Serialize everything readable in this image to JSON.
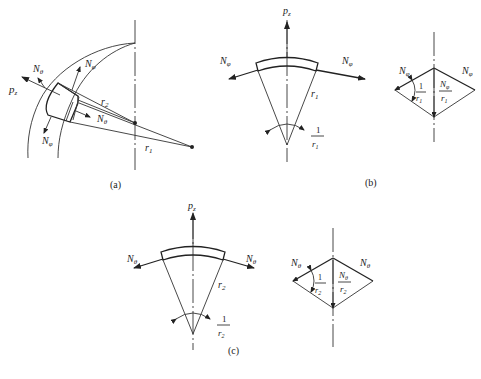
{
  "figure": {
    "panels": [
      {
        "id": "a",
        "caption": "(a)",
        "labels": {
          "pz": "p",
          "pz_sub": "z",
          "n_theta_top": "N",
          "n_theta_top_sub": "θ",
          "n_phi_top": "N",
          "n_phi_top_sub": "φ",
          "n_theta_right": "N",
          "n_theta_right_sub": "θ",
          "n_phi_bottom": "N",
          "n_phi_bottom_sub": "φ",
          "r2": "r",
          "r2_sub": "2",
          "r1": "r",
          "r1_sub": "1"
        }
      },
      {
        "id": "b",
        "caption": "(b)",
        "labels": {
          "pz": "p",
          "pz_sub": "z",
          "n_left": "N",
          "n_left_sub": "φ",
          "n_right": "N",
          "n_right_sub": "φ",
          "radius": "r",
          "radius_sub": "1",
          "angle_num": "1",
          "angle_den": "r",
          "angle_den_sub": "1",
          "rh_left": "N",
          "rh_left_sub": "φ",
          "rh_right": "N",
          "rh_right_sub": "φ",
          "rh_angle_num": "1",
          "rh_angle_den": "r",
          "rh_angle_den_sub": "1",
          "rh_res_num": "N",
          "rh_res_num_sub": "φ",
          "rh_res_den": "r",
          "rh_res_den_sub": "1"
        }
      },
      {
        "id": "c",
        "caption": "(c)",
        "labels": {
          "pz": "p",
          "pz_sub": "z",
          "n_left": "N",
          "n_left_sub": "θ",
          "n_right": "N",
          "n_right_sub": "θ",
          "radius": "r",
          "radius_sub": "2",
          "angle_num": "1",
          "angle_den": "r",
          "angle_den_sub": "2",
          "rh_left": "N",
          "rh_left_sub": "θ",
          "rh_right": "N",
          "rh_right_sub": "θ",
          "rh_angle_num": "1",
          "rh_angle_den": "r",
          "rh_angle_den_sub": "2",
          "rh_res_num": "N",
          "rh_res_num_sub": "θ",
          "rh_res_den": "r",
          "rh_res_den_sub": "2"
        }
      }
    ]
  }
}
